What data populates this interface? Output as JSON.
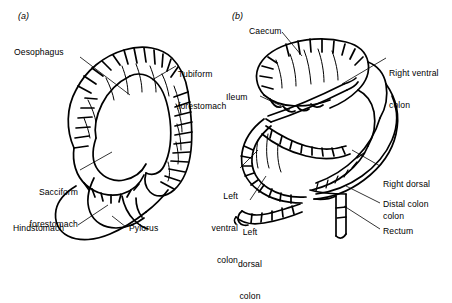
{
  "figure": {
    "type": "anatomical-line-diagram",
    "background_color": "#ffffff",
    "line_color": "#000000",
    "panels": [
      {
        "id": "a",
        "id_label": "(a)",
        "name": "stomach",
        "labels": [
          {
            "key": "oesophagus",
            "text": "Oesophagus"
          },
          {
            "key": "tubiform_forestomach",
            "line1": "Tubiform",
            "line2": "forestomach"
          },
          {
            "key": "sacciform_forestomach",
            "line1": "Sacciform",
            "line2": "forestomach"
          },
          {
            "key": "hindstomach",
            "text": "Hindstomach"
          },
          {
            "key": "pylorus",
            "text": "Pylorus"
          }
        ]
      },
      {
        "id": "b",
        "id_label": "(b)",
        "name": "large-intestine",
        "labels": [
          {
            "key": "caecum",
            "text": "Caecum"
          },
          {
            "key": "ileum",
            "text": "Ileum"
          },
          {
            "key": "right_ventral_colon",
            "line1": "Right ventral",
            "line2": "colon"
          },
          {
            "key": "right_dorsal_colon",
            "line1": "Right dorsal",
            "line2": "colon"
          },
          {
            "key": "left_ventral_colon",
            "line1": "Left",
            "line2": "ventral",
            "line3": "colon"
          },
          {
            "key": "left_dorsal_colon",
            "line1": "Left",
            "line2": "dorsal",
            "line3": "colon"
          },
          {
            "key": "distal_colon",
            "text": "Distal colon"
          },
          {
            "key": "rectum",
            "text": "Rectum"
          }
        ]
      }
    ]
  }
}
